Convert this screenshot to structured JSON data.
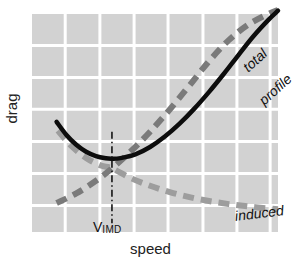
{
  "figure": {
    "width": 301,
    "height": 264,
    "background": "#ffffff",
    "plot_background": "#d2d2d2",
    "grid_color": "#ffffff"
  },
  "axes": {
    "xlabel": "speed",
    "ylabel": "drag"
  },
  "markers": {
    "vimd_symbol": "V",
    "vimd_subscript": "IMD"
  },
  "legend_inline": {
    "total": "total",
    "profile": "profile",
    "induced": "induced"
  },
  "chart_data": {
    "type": "line",
    "title": "",
    "xlabel": "speed",
    "ylabel": "drag",
    "xlim": [
      0,
      1
    ],
    "ylim": [
      0,
      1
    ],
    "grid": true,
    "grid_color": "#ffffff",
    "legend_position": "inline-on-curves",
    "axis_ticks": {
      "x_tick_labels": [],
      "y_tick_labels": [],
      "x_gridlines_normalized": [
        0.135,
        0.276,
        0.415,
        0.553,
        0.695,
        0.833,
        0.968
      ],
      "y_gridlines_normalized": [
        0.122,
        0.268,
        0.415,
        0.563,
        0.709,
        0.856
      ]
    },
    "annotations": [
      {
        "text": "V_IMD",
        "display": "V IMD",
        "type": "vertical-dash-dot-line",
        "x_normalized": 0.325,
        "y_top_normalized": 0.46,
        "y_bottom_normalized": 0.04,
        "meaning": "speed of minimum drag, where profile and induced drag are equal"
      }
    ],
    "series": [
      {
        "name": "total",
        "label": "total",
        "color": "#0d0d0d",
        "style": "solid",
        "linewidth": 4.5,
        "description": "U-shaped total drag curve, minimum at V_IMD",
        "points": [
          [
            0.1,
            0.505
          ],
          [
            0.14,
            0.445
          ],
          [
            0.18,
            0.4
          ],
          [
            0.22,
            0.368
          ],
          [
            0.26,
            0.348
          ],
          [
            0.3,
            0.338
          ],
          [
            0.325,
            0.336
          ],
          [
            0.36,
            0.339
          ],
          [
            0.42,
            0.356
          ],
          [
            0.48,
            0.39
          ],
          [
            0.54,
            0.438
          ],
          [
            0.6,
            0.497
          ],
          [
            0.66,
            0.566
          ],
          [
            0.72,
            0.643
          ],
          [
            0.78,
            0.726
          ],
          [
            0.84,
            0.813
          ],
          [
            0.9,
            0.898
          ],
          [
            0.96,
            0.972
          ],
          [
            1.0,
            1.015
          ]
        ]
      },
      {
        "name": "profile",
        "label": "profile",
        "color": "#7a7a7a",
        "style": "dashed",
        "linewidth": 6,
        "description": "profile (parasite) drag rising with the square of speed",
        "points": [
          [
            0.1,
            0.133
          ],
          [
            0.18,
            0.177
          ],
          [
            0.26,
            0.235
          ],
          [
            0.325,
            0.292
          ],
          [
            0.4,
            0.368
          ],
          [
            0.48,
            0.46
          ],
          [
            0.56,
            0.562
          ],
          [
            0.64,
            0.672
          ],
          [
            0.72,
            0.784
          ],
          [
            0.8,
            0.88
          ],
          [
            0.88,
            0.952
          ],
          [
            0.96,
            1.0
          ],
          [
            1.0,
            1.018
          ]
        ]
      },
      {
        "name": "induced",
        "label": "induced",
        "color": "#9d9d9d",
        "style": "dashed",
        "linewidth": 6,
        "description": "induced drag falling with the square of speed",
        "points": [
          [
            0.105,
            0.465
          ],
          [
            0.16,
            0.395
          ],
          [
            0.22,
            0.34
          ],
          [
            0.28,
            0.305
          ],
          [
            0.325,
            0.292
          ],
          [
            0.4,
            0.248
          ],
          [
            0.48,
            0.212
          ],
          [
            0.56,
            0.183
          ],
          [
            0.64,
            0.16
          ],
          [
            0.72,
            0.142
          ],
          [
            0.8,
            0.128
          ],
          [
            0.88,
            0.117
          ],
          [
            0.96,
            0.108
          ],
          [
            1.0,
            0.104
          ]
        ]
      }
    ]
  }
}
